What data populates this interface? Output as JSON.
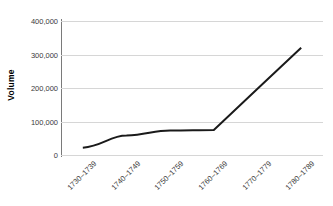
{
  "chart_data": {
    "type": "line",
    "title": "",
    "subtitle": "",
    "xlabel": "",
    "ylabel": "Volume",
    "categories": [
      "1730–1739",
      "1740–1749",
      "1750–1759",
      "1760–1769",
      "1770–1779",
      "1780–1789"
    ],
    "series": [
      {
        "name": "Volume",
        "values": [
          22000,
          58000,
          73000,
          75000,
          198000,
          320000
        ],
        "color": "#1a1a1a"
      }
    ],
    "ylim": [
      0,
      400000
    ],
    "y_ticks": [
      0,
      100000,
      200000,
      300000,
      400000
    ],
    "y_tick_labels": [
      "0",
      "100,000",
      "200,000",
      "300,000",
      "400,000"
    ],
    "grid": "horizontal",
    "legend": "none",
    "markers": "none",
    "line_width": 2,
    "x_tick_label_rotation": -45,
    "colors": {
      "line": "#1a1a1a",
      "gridline": "#d6d6d6",
      "axis": "#7a7a7a",
      "tick_text": "#3a3a3a",
      "axis_title": "#000000",
      "background": "#ffffff"
    }
  }
}
